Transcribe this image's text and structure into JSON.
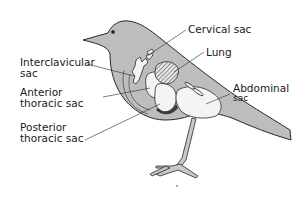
{
  "diagram": {
    "labels": {
      "cervical_sac": "Cervical sac",
      "lung": "Lung",
      "interclavicular_line1": "Interclavicular",
      "interclavicular_line2": "sac",
      "abdominal_line1": "Abdominal",
      "abdominal_line2": "sac",
      "anterior_line1": "Anterior",
      "anterior_line2": "thoracic sac",
      "posterior_line1": "Posterior",
      "posterior_line2": "thoracic sac"
    },
    "colors": {
      "body": "#bdbdbd",
      "sac": "#f4f4f4",
      "outline": "#2a2a2a",
      "background": "#ffffff"
    }
  }
}
